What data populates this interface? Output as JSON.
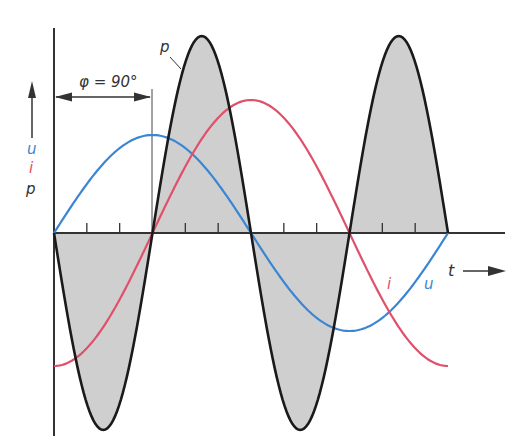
{
  "chart_data": {
    "type": "line",
    "title": "",
    "xlabel": "t",
    "ylabel": "u, i, p",
    "legend": [],
    "series": [
      {
        "name": "u",
        "color": "#3a86d4",
        "shape": "sine",
        "phase_deg": 0,
        "amplitude_rel": 0.49
      },
      {
        "name": "i",
        "color": "#e0506a",
        "shape": "negative cosine",
        "phase_deg": -90,
        "amplitude_rel": 0.67
      },
      {
        "name": "p",
        "color": "#1a1a1a",
        "fill": "#cfcfcf",
        "shape": "sine at double frequency",
        "amplitude_rel": 1.0
      }
    ],
    "x_range_periods": [
      0,
      1
    ],
    "grid": false,
    "annotations": [
      "φ = 90°",
      "p",
      "i",
      "u",
      "t"
    ]
  },
  "labels": {
    "phi": "φ = 90°",
    "p_curve": "p",
    "u_axis": "u",
    "i_axis": "i",
    "p_axis": "p",
    "i_curve": "i",
    "u_curve": "u",
    "t_axis": "t"
  },
  "colors": {
    "u": "#3a86d4",
    "i": "#e0506a",
    "p": "#1a1a1a",
    "p_fill": "#cfcfcf",
    "axis": "#333333"
  },
  "geometry": {
    "origin_x": 54,
    "zero_y": 233,
    "period_px": 394,
    "u_amp": 98,
    "i_amp": 133,
    "p_amp": 197
  }
}
